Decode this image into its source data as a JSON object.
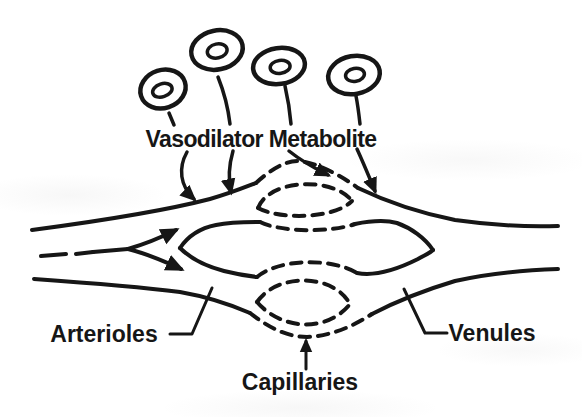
{
  "diagram": {
    "type": "line-art physiology figure of a microcirculatory bed",
    "background_color": "#ffffff",
    "ink_color": "#161616",
    "labels": {
      "metabolite": "Vasodilator Metabolite",
      "arterioles": "Arterioles",
      "venules": "Venules",
      "capillaries": "Capillaries"
    },
    "metabolite_cell_count": 4,
    "metabolite_arrow_count": 4,
    "line_styles": {
      "arterioles_and_venules": "solid",
      "capillaries": "dashed"
    }
  }
}
